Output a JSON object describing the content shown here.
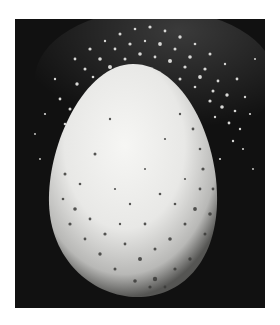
{
  "image": {
    "subject": "egg with speckled, pitted surface and scattered particles against black background",
    "style": "black-and-white photograph",
    "colors": {
      "background": "#ffffff",
      "frame": "#111111",
      "egg_highlight": "#f4f4f2",
      "egg_shadow": "#6a6a68",
      "speckle": "#3a3a38",
      "particle": "#d8d8d6"
    }
  }
}
